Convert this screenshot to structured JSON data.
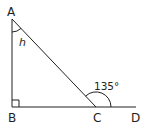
{
  "diagram": {
    "stroke_color": "#231f20",
    "points": {
      "A": {
        "label": "A",
        "x": 12,
        "y": 19
      },
      "B": {
        "label": "B",
        "x": 12,
        "y": 107
      },
      "C": {
        "label": "C",
        "x": 96,
        "y": 107
      },
      "D": {
        "label": "D",
        "x": 136,
        "y": 107
      }
    },
    "angles": {
      "at_A": {
        "label": "h"
      },
      "exterior_at_C": {
        "label": "135°"
      },
      "at_B": {
        "label": "right-angle"
      }
    }
  }
}
